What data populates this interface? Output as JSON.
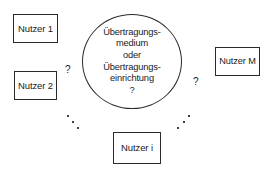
{
  "diagram": {
    "type": "star-topology-communication-diagram",
    "language": "de",
    "background_color": "#ffffff",
    "stroke_color": "#2b2b2b",
    "text_color": "#1a1a1a",
    "nodes": [
      {
        "id": "nutzer-1",
        "label": "Nutzer 1"
      },
      {
        "id": "nutzer-2",
        "label": "Nutzer 2"
      },
      {
        "id": "nutzer-m",
        "label": "Nutzer M"
      },
      {
        "id": "nutzer-i",
        "label": "Nutzer i"
      }
    ],
    "center": {
      "id": "uebertragungsmedium",
      "shape": "ellipse",
      "lines": [
        "Übertragungs-",
        "medium",
        "oder",
        "Übertragungs-",
        "einrichtung",
        "?"
      ]
    },
    "annotations": [
      {
        "id": "question-left",
        "text": "?"
      },
      {
        "id": "question-right",
        "text": "?"
      }
    ],
    "ellipsis": [
      {
        "id": "ellipsis-left",
        "dots": 3,
        "direction": "down-right"
      },
      {
        "id": "ellipsis-right",
        "dots": 3,
        "direction": "down-left"
      }
    ]
  }
}
